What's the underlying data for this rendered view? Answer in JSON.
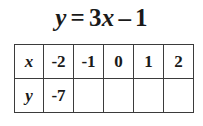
{
  "equation": {
    "lhs": "y",
    "relation": "=",
    "coefficient": "3",
    "variable": "x",
    "operator": "–",
    "constant": "1",
    "full_text": "y = 3x – 1"
  },
  "table": {
    "rows": [
      {
        "label": "x",
        "cells": [
          "-2",
          "-1",
          "0",
          "1",
          "2"
        ]
      },
      {
        "label": "y",
        "cells": [
          "-7",
          "",
          "",
          "",
          ""
        ]
      }
    ]
  },
  "colors": {
    "background": "#ffffff",
    "text": "#1a1a1a",
    "border": "#3b3b3b"
  }
}
